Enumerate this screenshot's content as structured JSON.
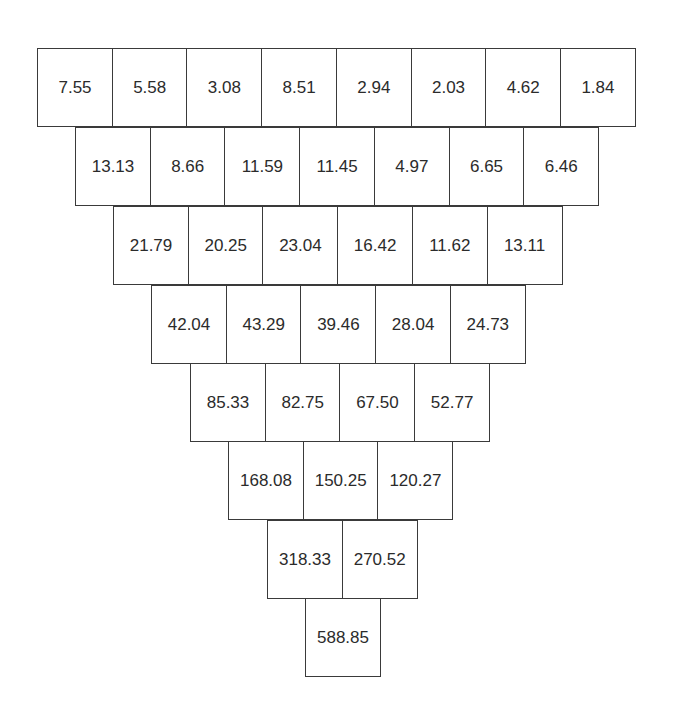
{
  "diagram": {
    "type": "inverted-number-pyramid",
    "rows": [
      [
        "7.55",
        "5.58",
        "3.08",
        "8.51",
        "2.94",
        "2.03",
        "4.62",
        "1.84"
      ],
      [
        "13.13",
        "8.66",
        "11.59",
        "11.45",
        "4.97",
        "6.65",
        "6.46"
      ],
      [
        "21.79",
        "20.25",
        "23.04",
        "16.42",
        "11.62",
        "13.11"
      ],
      [
        "42.04",
        "43.29",
        "39.46",
        "28.04",
        "24.73"
      ],
      [
        "85.33",
        "82.75",
        "67.50",
        "52.77"
      ],
      [
        "168.08",
        "150.25",
        "120.27"
      ],
      [
        "318.33",
        "270.52"
      ],
      [
        "588.85"
      ]
    ]
  },
  "colors": {
    "border": "#3a3a3a",
    "text": "#2b2b2b",
    "background": "#ffffff"
  }
}
